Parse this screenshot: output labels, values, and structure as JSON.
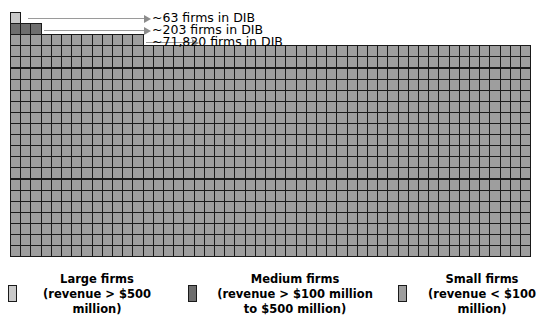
{
  "chart_data": {
    "type": "bar",
    "title": "",
    "xlabel": "",
    "ylabel": "",
    "categories": [
      "Large firms",
      "Medium firms",
      "Small firms"
    ],
    "values": [
      63,
      203,
      71820
    ],
    "value_labels": [
      "~63 firms in DIB",
      "~203 firms in DIB",
      "~71,820 firms in DIB"
    ],
    "series": [
      {
        "name": "Large firms",
        "value": 63,
        "value_label": "~63 firms in DIB",
        "color": "#c9c9c9",
        "squares": 1
      },
      {
        "name": "Medium firms",
        "value": 203,
        "value_label": "~203 firms in DIB",
        "color": "#6e6e6e",
        "squares": 3
      },
      {
        "name": "Small firms",
        "value": 71820,
        "value_label": "~71,820 firms in DIB",
        "color": "#9e9e9e",
        "squares": 1082
      }
    ],
    "grid": {
      "columns": 51,
      "cell_width": 10.2,
      "cell_height": 11.1,
      "origin_x": 10,
      "origin_y": 12,
      "full_rows_start_y": 45,
      "full_rows": 19,
      "bottom_y": 256,
      "right_x": 530
    },
    "legend_position": "bottom"
  },
  "annotations": [
    {
      "id": "large",
      "text": "~63 firms in DIB",
      "line_x": 28,
      "line_y": 18,
      "line_width": 116,
      "text_x": 152,
      "text_y": 11
    },
    {
      "id": "medium",
      "text": "~203 firms in DIB",
      "line_x": 44,
      "line_y": 30,
      "line_width": 100,
      "text_x": 152,
      "text_y": 23
    },
    {
      "id": "small",
      "text": "~71,820 firms in DIB",
      "line_x": 146,
      "line_y": 42,
      "line_width": 46,
      "text_x": 152,
      "text_y": 35
    }
  ],
  "legend": {
    "items": [
      {
        "id": "large",
        "label": "Large firms\n(revenue > $500\nmillion)",
        "title": "Large firms",
        "detail_line1": "(revenue > $500",
        "detail_line2": "million)",
        "color": "#c9c9c9"
      },
      {
        "id": "medium",
        "label": "Medium firms\n(revenue > $100 million\nto $500 million)",
        "title": "Medium firms",
        "detail_line1": "(revenue > $100 million",
        "detail_line2": "to $500 million)",
        "color": "#6e6e6e"
      },
      {
        "id": "small",
        "label": "Small firms\n(revenue < $100\nmillion)",
        "title": "Small firms",
        "detail_line1": "(revenue < $100",
        "detail_line2": "million)",
        "color": "#9e9e9e"
      }
    ]
  },
  "colors": {
    "large": "#c9c9c9",
    "medium": "#6e6e6e",
    "small": "#9e9e9e",
    "cell_border": "#1a1a1a",
    "callout": "#8c8c8c",
    "background": "#ffffff",
    "text": "#000000"
  }
}
